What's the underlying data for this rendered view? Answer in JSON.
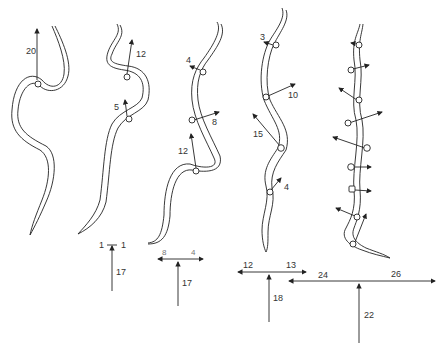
{
  "figure": {
    "snakes": [
      {
        "id": 1,
        "vectors": [
          {
            "label": "20"
          }
        ]
      },
      {
        "id": 2,
        "vectors": [
          {
            "label": "12"
          },
          {
            "label": "5"
          }
        ]
      },
      {
        "id": 3,
        "vectors": [
          {
            "label": "4"
          },
          {
            "label": "8"
          },
          {
            "label": "12"
          }
        ]
      },
      {
        "id": 4,
        "vectors": [
          {
            "label": "3"
          },
          {
            "label": "10"
          },
          {
            "label": "15"
          },
          {
            "label": "4"
          }
        ]
      },
      {
        "id": 5,
        "vectors": [
          {
            "label": ""
          },
          {
            "label": ""
          },
          {
            "label": ""
          },
          {
            "label": ""
          },
          {
            "label": ""
          },
          {
            "label": ""
          },
          {
            "label": ""
          },
          {
            "label": ""
          },
          {
            "label": ""
          }
        ]
      }
    ],
    "resultants": [
      {
        "left": "1",
        "right": "1",
        "forward": "17"
      },
      {
        "left": "8",
        "right": "4",
        "forward": "17"
      },
      {
        "left": "12",
        "right": "13",
        "forward": "18"
      },
      {
        "left": "24",
        "right": "26",
        "forward": "22"
      }
    ]
  }
}
